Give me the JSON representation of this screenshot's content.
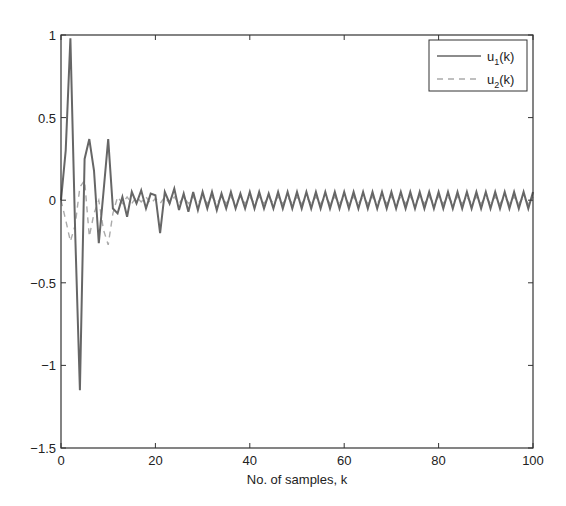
{
  "chart_data": {
    "type": "line",
    "title": "",
    "xlabel": "No. of samples, k",
    "ylabel": "",
    "xlim": [
      0,
      100
    ],
    "ylim": [
      -1.5,
      1
    ],
    "xticks": [
      0,
      20,
      40,
      60,
      80,
      100
    ],
    "xtick_labels": [
      "0",
      "20",
      "40",
      "60",
      "80",
      "100"
    ],
    "yticks": [
      -1.5,
      -1,
      -0.5,
      0,
      0.5,
      1
    ],
    "ytick_labels": [
      "-1.5",
      "-1",
      "-0.5",
      "0",
      "0.5",
      "1"
    ],
    "grid": false,
    "legend_position": "upper right",
    "series": [
      {
        "name": "u1(k)",
        "legend_main": "u",
        "legend_sub": "1",
        "legend_suffix": "(k)",
        "style": "solid",
        "color": "#666666",
        "x": [
          0,
          1,
          2,
          3,
          4,
          5,
          6,
          7,
          8,
          9,
          10,
          11,
          12,
          13,
          14,
          15,
          16,
          17,
          18,
          19,
          20,
          21,
          22,
          23,
          24,
          25,
          26,
          27,
          28,
          29,
          30,
          31,
          32,
          33,
          34,
          35,
          36,
          37,
          38,
          39,
          40,
          41,
          42,
          43,
          44,
          45,
          46,
          47,
          48,
          49,
          50,
          51,
          52,
          53,
          54,
          55,
          56,
          57,
          58,
          59,
          60,
          61,
          62,
          63,
          64,
          65,
          66,
          67,
          68,
          69,
          70,
          71,
          72,
          73,
          74,
          75,
          76,
          77,
          78,
          79,
          80,
          81,
          82,
          83,
          84,
          85,
          86,
          87,
          88,
          89,
          90,
          91,
          92,
          93,
          94,
          95,
          96,
          97,
          98,
          99,
          100
        ],
        "values": [
          0,
          0.3,
          0.98,
          -0.2,
          -1.15,
          0.25,
          0.37,
          0.18,
          -0.26,
          0.05,
          0.37,
          -0.05,
          -0.08,
          0.02,
          -0.1,
          0.05,
          -0.02,
          0.06,
          -0.05,
          0.04,
          0.03,
          -0.2,
          0.05,
          -0.02,
          0.07,
          -0.06,
          0.04,
          -0.07,
          0.05,
          -0.06,
          0.05,
          -0.05,
          0.05,
          -0.06,
          0.04,
          -0.05,
          0.05,
          -0.05,
          0.04,
          -0.05,
          0.05,
          -0.05,
          0.05,
          -0.05,
          0.04,
          -0.05,
          0.05,
          -0.05,
          0.05,
          -0.05,
          0.05,
          -0.05,
          0.05,
          -0.05,
          0.05,
          -0.05,
          0.05,
          -0.05,
          0.05,
          -0.05,
          0.05,
          -0.05,
          0.05,
          -0.05,
          0.05,
          -0.05,
          0.05,
          -0.05,
          0.05,
          -0.05,
          0.05,
          -0.05,
          0.05,
          -0.05,
          0.05,
          -0.05,
          0.05,
          -0.05,
          0.05,
          -0.05,
          0.05,
          -0.05,
          0.05,
          -0.05,
          0.05,
          -0.05,
          0.05,
          -0.05,
          0.05,
          -0.05,
          0.05,
          -0.05,
          0.05,
          -0.05,
          0.05,
          -0.05,
          0.05,
          -0.05,
          0.05,
          -0.05,
          0.05
        ]
      },
      {
        "name": "u2(k)",
        "legend_main": "u",
        "legend_sub": "2",
        "legend_suffix": "(k)",
        "style": "dashed",
        "color": "#aaaaaa",
        "x": [
          0,
          1,
          2,
          3,
          4,
          5,
          6,
          7,
          8,
          9,
          10,
          11,
          12,
          13,
          14,
          15,
          16,
          17,
          18,
          19,
          20,
          21,
          22,
          23,
          24,
          25,
          26,
          27,
          28,
          29,
          30,
          31,
          32,
          33,
          34,
          35,
          36,
          37,
          38,
          39,
          40,
          41,
          42,
          43,
          44,
          45,
          46,
          47,
          48,
          49,
          50,
          51,
          52,
          53,
          54,
          55,
          56,
          57,
          58,
          59,
          60,
          61,
          62,
          63,
          64,
          65,
          66,
          67,
          68,
          69,
          70,
          71,
          72,
          73,
          74,
          75,
          76,
          77,
          78,
          79,
          80,
          81,
          82,
          83,
          84,
          85,
          86,
          87,
          88,
          89,
          90,
          91,
          92,
          93,
          94,
          95,
          96,
          97,
          98,
          99,
          100
        ],
        "values": [
          0,
          -0.12,
          -0.25,
          -0.15,
          0.08,
          0.12,
          -0.22,
          -0.08,
          0.0,
          -0.18,
          -0.27,
          -0.08,
          0.02,
          -0.02,
          0.02,
          -0.02,
          0.02,
          -0.01,
          0.02,
          -0.02,
          0.01,
          -0.02,
          0.02,
          -0.02,
          0.02,
          -0.02,
          0.02,
          -0.02,
          0.02,
          -0.02,
          0.02,
          -0.02,
          0.02,
          -0.02,
          0.02,
          -0.02,
          0.02,
          -0.02,
          0.02,
          -0.02,
          0.02,
          -0.02,
          0.02,
          -0.02,
          0.02,
          -0.02,
          0.02,
          -0.02,
          0.02,
          -0.02,
          0.02,
          -0.02,
          0.02,
          -0.02,
          0.02,
          -0.02,
          0.02,
          -0.02,
          0.02,
          -0.02,
          0.02,
          -0.02,
          0.02,
          -0.02,
          0.02,
          -0.02,
          0.02,
          -0.02,
          0.02,
          -0.02,
          0.02,
          -0.02,
          0.02,
          -0.02,
          0.02,
          -0.02,
          0.02,
          -0.02,
          0.02,
          -0.02,
          0.02,
          -0.02,
          0.02,
          -0.02,
          0.02,
          -0.02,
          0.02,
          -0.02,
          0.02,
          -0.02,
          0.02,
          -0.02,
          0.02,
          -0.02,
          0.02,
          -0.02,
          0.02,
          -0.02,
          0.02,
          -0.02,
          0.02
        ]
      }
    ]
  }
}
